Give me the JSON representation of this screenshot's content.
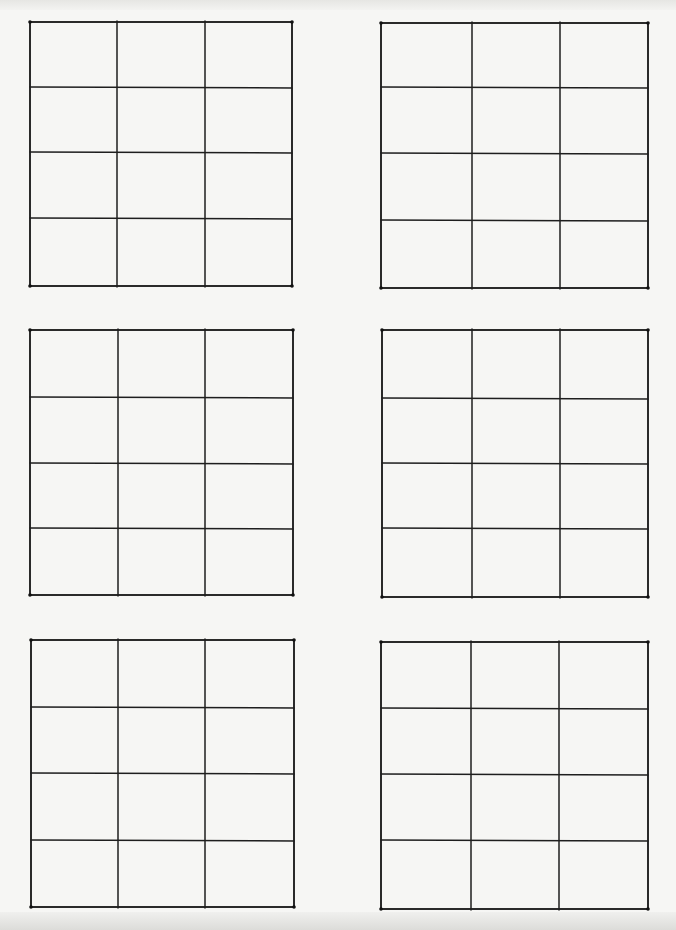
{
  "page": {
    "background_color": "#f6f6f4",
    "line_color": "#1e1e1e"
  },
  "grids": [
    {
      "id": "grid-top-left",
      "rows": 4,
      "columns": 3,
      "cells_filled": 0
    },
    {
      "id": "grid-top-right",
      "rows": 4,
      "columns": 3,
      "cells_filled": 0
    },
    {
      "id": "grid-middle-left",
      "rows": 4,
      "columns": 3,
      "cells_filled": 0
    },
    {
      "id": "grid-middle-right",
      "rows": 4,
      "columns": 3,
      "cells_filled": 0
    },
    {
      "id": "grid-bottom-left",
      "rows": 4,
      "columns": 3,
      "cells_filled": 0
    },
    {
      "id": "grid-bottom-right",
      "rows": 4,
      "columns": 3,
      "cells_filled": 0
    }
  ]
}
